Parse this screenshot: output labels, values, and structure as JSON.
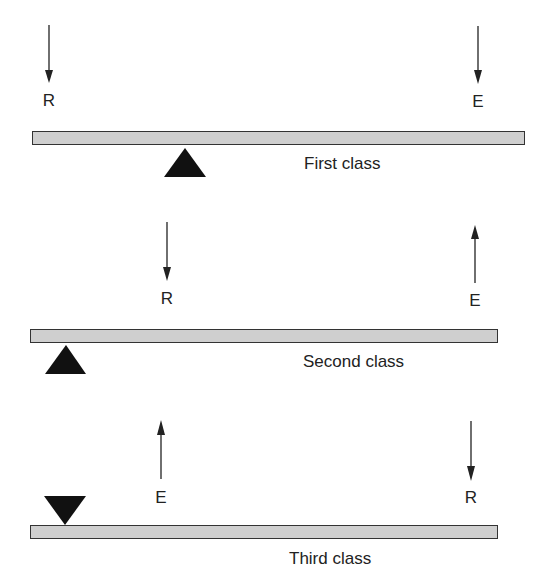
{
  "diagram": {
    "panels": [
      {
        "name": "First class",
        "label": "First class",
        "forces": [
          {
            "letter": "R",
            "direction": "down"
          },
          {
            "letter": "E",
            "direction": "down"
          }
        ],
        "fulcrum": "triangle-up-below-lever-middle"
      },
      {
        "name": "Second class",
        "label": "Second class",
        "forces": [
          {
            "letter": "R",
            "direction": "down"
          },
          {
            "letter": "E",
            "direction": "up"
          }
        ],
        "fulcrum": "triangle-up-below-lever-left-end"
      },
      {
        "name": "Third class",
        "label": "Third class",
        "forces": [
          {
            "letter": "E",
            "direction": "up"
          },
          {
            "letter": "R",
            "direction": "down"
          }
        ],
        "fulcrum": "triangle-down-above-lever-left-end"
      }
    ],
    "colors": {
      "lever_fill": "#cfcfcf",
      "outline": "#333333",
      "fulcrum": "#111111"
    }
  }
}
